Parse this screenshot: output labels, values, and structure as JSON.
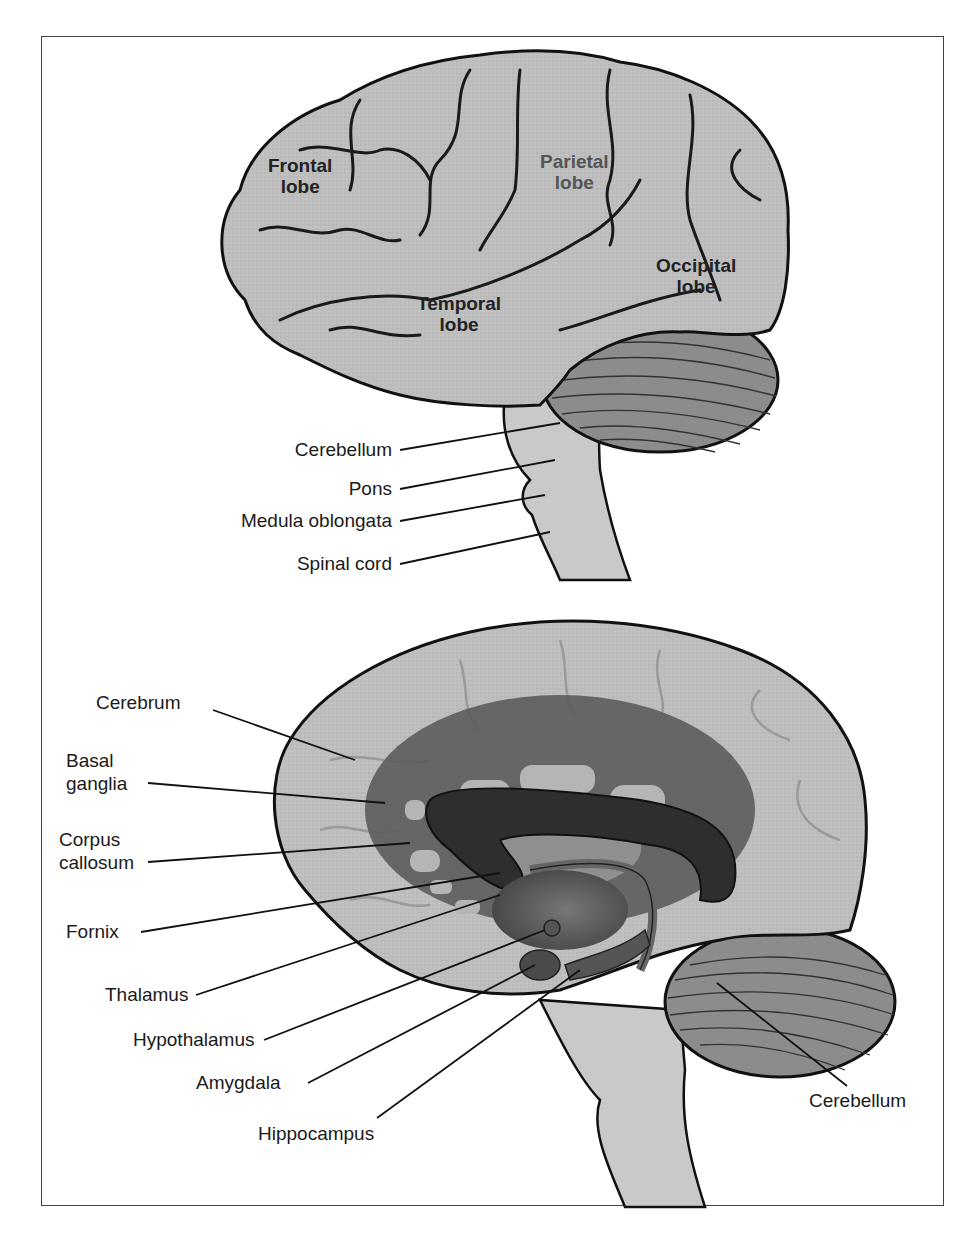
{
  "figure": {
    "top_view": {
      "lobes": [
        {
          "name": "Frontal",
          "suffix": "lobe"
        },
        {
          "name": "Parietal",
          "suffix": "lobe"
        },
        {
          "name": "Temporal",
          "suffix": "lobe"
        },
        {
          "name": "Occipital",
          "suffix": "lobe"
        }
      ],
      "labels": [
        "Cerebellum",
        "Pons",
        "Medula oblongata",
        "Spinal cord"
      ]
    },
    "bottom_view": {
      "labels_left": [
        "Cerebrum",
        "Basal",
        "ganglia",
        "Corpus",
        "callosum",
        "Fornix",
        "Thalamus",
        "Hypothalamus",
        "Amygdala",
        "Hippocampus"
      ],
      "label_right": "Cerebellum"
    },
    "colors": {
      "brain_fill": "#bdbdbd",
      "outline": "#111111",
      "limbic_dark": "#5a5a5a",
      "cerebellum": "#8a8a8a",
      "stem": "#c8c8c8"
    }
  }
}
